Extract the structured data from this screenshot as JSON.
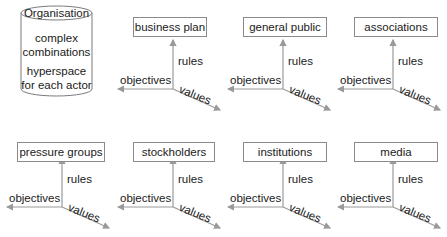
{
  "organisation": {
    "title": "Organisation",
    "line1": "complex",
    "line2": "combinations",
    "line3": "hyperspace",
    "line4": "for each actor"
  },
  "axis_labels": {
    "vertical": "rules",
    "horizontal": "objectives",
    "diagonal": "values"
  },
  "colors": {
    "axis": "#9a9a9a",
    "box_border": "#8a8a8a",
    "text": "#1a1a1a"
  },
  "actors": [
    {
      "label": "business plan"
    },
    {
      "label": "general public"
    },
    {
      "label": "associations"
    },
    {
      "label": "pressure groups"
    },
    {
      "label": "stockholders"
    },
    {
      "label": "institutions"
    },
    {
      "label": "media"
    }
  ]
}
